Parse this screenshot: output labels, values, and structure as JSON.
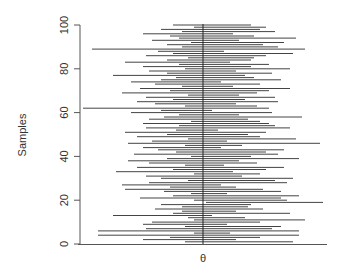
{
  "chart_data": {
    "type": "interval",
    "title": "",
    "xlabel": "θ",
    "ylabel": "Samples",
    "ylim": [
      0,
      100
    ],
    "yticks": [
      0,
      20,
      40,
      60,
      80,
      100
    ],
    "ytick_labels": [
      "0",
      "20",
      "40",
      "60",
      "80",
      "100"
    ],
    "grid": false,
    "legend": null,
    "reference_line": {
      "x": 0,
      "label": "θ (true value)"
    },
    "x_units": "relative to θ",
    "intervals": [
      [
        -0.3,
        1.5
      ],
      [
        -1.0,
        0.55
      ],
      [
        -0.55,
        0.95
      ],
      [
        -1.75,
        1.6
      ],
      [
        -0.15,
        0.45
      ],
      [
        -1.75,
        1.6
      ],
      [
        -0.95,
        1.15
      ],
      [
        -0.3,
        1.3
      ],
      [
        -1.0,
        0.4
      ],
      [
        -0.85,
        0.95
      ],
      [
        -0.15,
        1.7
      ],
      [
        -0.25,
        0.7
      ],
      [
        -1.5,
        0.15
      ],
      [
        -0.5,
        1.45
      ],
      [
        -0.35,
        0.55
      ],
      [
        -0.8,
        1.0
      ],
      [
        -0.35,
        0.75
      ],
      [
        -0.7,
        0.8
      ],
      [
        0.05,
        2.0
      ],
      [
        -0.15,
        1.4
      ],
      [
        -1.05,
        1.3
      ],
      [
        -0.5,
        1.6
      ],
      [
        -0.2,
        0.4
      ],
      [
        -0.65,
        1.3
      ],
      [
        -1.3,
        1.0
      ],
      [
        -0.55,
        0.55
      ],
      [
        -1.35,
        0.3
      ],
      [
        -0.9,
        1.4
      ],
      [
        -0.25,
        1.2
      ],
      [
        -0.7,
        1.5
      ],
      [
        -0.95,
        0.65
      ],
      [
        -0.15,
        0.95
      ],
      [
        -1.45,
        0.5
      ],
      [
        -0.5,
        1.05
      ],
      [
        -1.1,
        1.35
      ],
      [
        -0.3,
        0.35
      ],
      [
        -0.9,
        0.9
      ],
      [
        -1.25,
        0.6
      ],
      [
        -0.6,
        1.6
      ],
      [
        -0.2,
        0.8
      ],
      [
        -1.15,
        1.25
      ],
      [
        -0.45,
        1.05
      ],
      [
        -0.75,
        1.35
      ],
      [
        -1.0,
        0.3
      ],
      [
        -0.3,
        0.65
      ],
      [
        -1.25,
        1.95
      ],
      [
        -0.85,
        0.4
      ],
      [
        -0.25,
        1.55
      ],
      [
        -1.1,
        0.95
      ],
      [
        -0.6,
        0.75
      ],
      [
        -1.3,
        1.05
      ],
      [
        -0.45,
        0.25
      ],
      [
        -0.95,
        1.45
      ],
      [
        -0.4,
        1.2
      ],
      [
        -1.0,
        1.1
      ],
      [
        -0.2,
        0.95
      ],
      [
        -0.9,
        0.75
      ],
      [
        -0.65,
        1.65
      ],
      [
        -0.4,
        0.6
      ],
      [
        -1.2,
        1.15
      ],
      [
        -0.7,
        0.15
      ],
      [
        -2.0,
        1.1
      ],
      [
        -0.3,
        0.9
      ],
      [
        -0.8,
        0.55
      ],
      [
        -1.1,
        1.25
      ],
      [
        -0.5,
        0.7
      ],
      [
        -0.95,
        1.2
      ],
      [
        -0.25,
        0.6
      ],
      [
        -1.35,
        0.9
      ],
      [
        -0.55,
        1.1
      ],
      [
        -1.05,
        1.45
      ],
      [
        -0.35,
        0.5
      ],
      [
        -0.8,
        0.95
      ],
      [
        -1.2,
        0.3
      ],
      [
        -0.7,
        1.3
      ],
      [
        -0.45,
        0.85
      ],
      [
        -1.5,
        0.7
      ],
      [
        -0.6,
        1.15
      ],
      [
        -0.9,
        0.55
      ],
      [
        -0.3,
        1.45
      ],
      [
        -1.0,
        0.8
      ],
      [
        -0.4,
        1.1
      ],
      [
        -1.3,
        0.45
      ],
      [
        -0.6,
        0.8
      ],
      [
        -0.25,
        0.85
      ],
      [
        -0.95,
        1.05
      ],
      [
        -0.5,
        1.5
      ],
      [
        -0.75,
        0.35
      ],
      [
        -1.85,
        1.7
      ],
      [
        -0.35,
        1.25
      ],
      [
        -0.6,
        1.0
      ],
      [
        -0.2,
        1.35
      ],
      [
        -0.85,
        0.6
      ],
      [
        -0.4,
        1.55
      ],
      [
        -0.55,
        0.85
      ],
      [
        -1.0,
        0.5
      ],
      [
        -0.35,
        1.2
      ],
      [
        -0.7,
        0.95
      ],
      [
        -0.15,
        1.05
      ],
      [
        -0.5,
        0.8
      ]
    ]
  }
}
